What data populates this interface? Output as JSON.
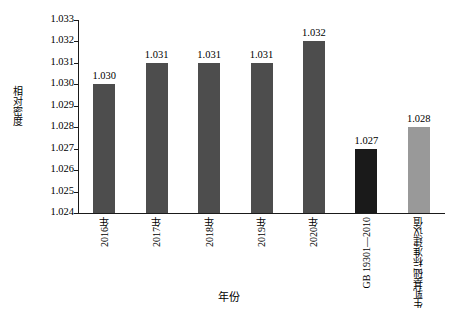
{
  "chart_data": {
    "type": "bar",
    "title": "",
    "xlabel": "年份",
    "ylabel": "相对密度",
    "ylim": [
      1.024,
      1.033
    ],
    "ytick_labels": [
      "1.033",
      "1.032",
      "1.031",
      "1.030",
      "1.029",
      "1.028",
      "1.027",
      "1.026",
      "1.025",
      "1.024"
    ],
    "ytick_values": [
      1.033,
      1.032,
      1.031,
      1.03,
      1.029,
      1.028,
      1.027,
      1.026,
      1.025,
      1.024
    ],
    "grid": false,
    "legend": "none",
    "categories": [
      "2016年",
      "2017年",
      "2018年",
      "2019年",
      "2020年",
      "GB 19301—2010",
      "生乳基础标准建议值"
    ],
    "category_lines": [
      [
        "2016年"
      ],
      [
        "2017年"
      ],
      [
        "2018年"
      ],
      [
        "2019年"
      ],
      [
        "2020年"
      ],
      [
        "GB 19301—2010"
      ],
      [
        "生乳基础",
        "标准建议值"
      ]
    ],
    "values": [
      1.03,
      1.031,
      1.031,
      1.031,
      1.032,
      1.027,
      1.028
    ],
    "value_labels": [
      "1.030",
      "1.031",
      "1.031",
      "1.031",
      "1.032",
      "1.027",
      "1.028"
    ],
    "bar_colors": [
      "#4d4d4d",
      "#4d4d4d",
      "#4d4d4d",
      "#4d4d4d",
      "#4d4d4d",
      "#1a1a1a",
      "#999999"
    ],
    "axis_color": "#1a1a1a",
    "background_color": "#ffffff"
  }
}
